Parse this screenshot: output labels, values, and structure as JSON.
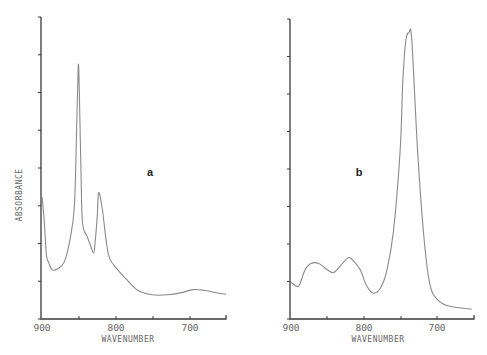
{
  "chart_data": [
    {
      "type": "line",
      "panel_label": "a",
      "title": "",
      "xlabel": "WAVENUMBER",
      "ylabel": "ABSORBANCE",
      "x_ticks": [
        "900",
        "800",
        "700"
      ],
      "xlim": [
        900,
        650
      ],
      "ylim": [
        0,
        8
      ],
      "y_tick_count": 9,
      "y_tick_labels": [],
      "grid": false,
      "series": [
        {
          "name": "spectrum a",
          "x": [
            900,
            897,
            894,
            891,
            886,
            879,
            870,
            862,
            856,
            853,
            851,
            850,
            849,
            847,
            845,
            839,
            835,
            830,
            828,
            825,
            823,
            818,
            813,
            808,
            797,
            785,
            770,
            750,
            730,
            710,
            695,
            680,
            660,
            650
          ],
          "y": [
            3.24,
            2.6,
            1.7,
            1.5,
            1.3,
            1.33,
            1.5,
            2.1,
            3.0,
            5.0,
            6.6,
            6.6,
            5.8,
            3.9,
            2.55,
            2.2,
            2.0,
            1.75,
            2.0,
            2.7,
            3.35,
            2.9,
            2.1,
            1.6,
            1.3,
            1.05,
            0.76,
            0.64,
            0.64,
            0.7,
            0.78,
            0.76,
            0.68,
            0.66
          ]
        }
      ]
    },
    {
      "type": "line",
      "panel_label": "b",
      "title": "",
      "xlabel": "WAVENUMBER",
      "ylabel": "",
      "x_ticks": [
        "900",
        "800",
        "700"
      ],
      "xlim": [
        900,
        650
      ],
      "ylim": [
        0,
        8
      ],
      "y_tick_count": 9,
      "y_tick_labels": [],
      "grid": false,
      "series": [
        {
          "name": "spectrum b",
          "x": [
            900,
            892,
            888,
            881,
            873,
            862,
            851,
            842,
            832,
            821,
            813,
            805,
            797,
            788,
            778,
            769,
            760,
            751,
            747,
            743,
            739,
            735,
            727,
            718,
            710,
            699,
            683,
            653
          ],
          "y": [
            0.98,
            0.87,
            0.93,
            1.3,
            1.48,
            1.48,
            1.32,
            1.24,
            1.43,
            1.64,
            1.51,
            1.3,
            0.9,
            0.69,
            0.82,
            1.3,
            2.35,
            4.47,
            6.45,
            7.44,
            7.63,
            7.44,
            4.47,
            2.1,
            0.9,
            0.5,
            0.34,
            0.26
          ]
        }
      ]
    }
  ],
  "labels": {
    "ylabel": "ABSORBANCE",
    "xlabel_a": "WAVENUMBER",
    "xlabel_b": "WAVENUMBER",
    "panel_a": "a",
    "panel_b": "b",
    "ticks_a": [
      "900",
      "800",
      "700"
    ],
    "ticks_b": [
      "900",
      "800",
      "700"
    ]
  }
}
